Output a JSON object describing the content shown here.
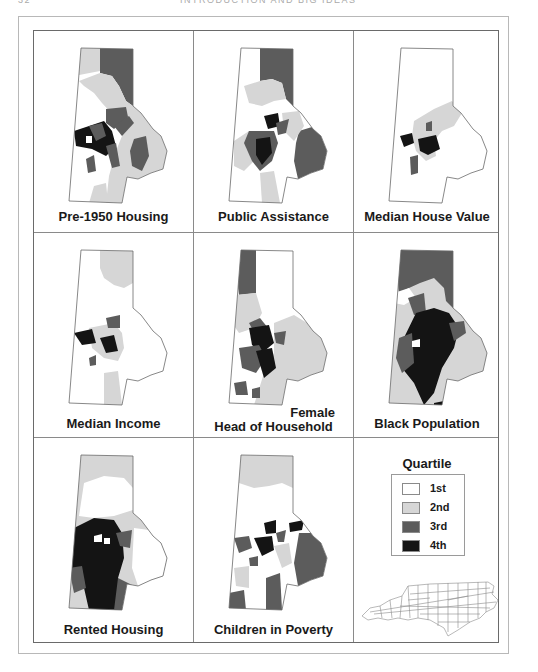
{
  "page_header": {
    "page_number": "32",
    "running_title": "INTRODUCTION AND BIG IDEAS"
  },
  "colors": {
    "q1": "#ffffff",
    "q2": "#d6d6d6",
    "q3": "#5c5c5c",
    "q4": "#141414",
    "outline": "#6a6a6a"
  },
  "panels": [
    {
      "label": "Pre-1950 Housing"
    },
    {
      "label": "Public Assistance"
    },
    {
      "label": "Median House Value"
    },
    {
      "label": "Median Income"
    },
    {
      "label_line1": "Female",
      "label_line2": "Head of Household"
    },
    {
      "label": "Black Population"
    },
    {
      "label": "Rented Housing"
    },
    {
      "label": "Children in Poverty"
    }
  ],
  "legend": {
    "title": "Quartile",
    "items": [
      {
        "label": "1st",
        "color": "#ffffff"
      },
      {
        "label": "2nd",
        "color": "#d6d6d6"
      },
      {
        "label": "3rd",
        "color": "#5c5c5c"
      },
      {
        "label": "4th",
        "color": "#141414"
      }
    ],
    "inset_map": "North Carolina counties"
  }
}
